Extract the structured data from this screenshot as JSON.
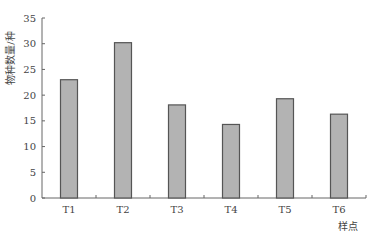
{
  "chart_data": {
    "type": "bar",
    "title": "",
    "xlabel": "样点",
    "ylabel": "物种数量/种",
    "categories": [
      "T1",
      "T2",
      "T3",
      "T4",
      "T5",
      "T6"
    ],
    "values": [
      23,
      30.2,
      18.1,
      14.3,
      19.3,
      16.3
    ],
    "ylim": [
      0,
      35
    ],
    "yticks": [
      0,
      5,
      10,
      15,
      20,
      25,
      30,
      35
    ],
    "grid": false,
    "legend": null,
    "colors": {
      "bar_fill": "#b3b3b3",
      "bar_stroke": "#555555",
      "axis": "#666666"
    }
  }
}
